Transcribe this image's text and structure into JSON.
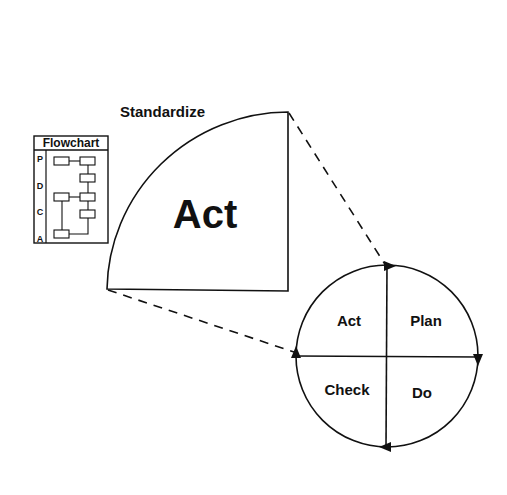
{
  "diagram": {
    "sector": {
      "caption": "Standardize",
      "label": "Act"
    },
    "flowchart": {
      "title": "Flowchart",
      "rows": [
        "P",
        "D",
        "C",
        "A"
      ]
    },
    "cycle": {
      "quadrants": {
        "top_left": "Act",
        "top_right": "Plan",
        "bottom_right": "Do",
        "bottom_left": "Check"
      },
      "direction": "clockwise"
    },
    "colors": {
      "line": "#111111",
      "background": "#ffffff"
    }
  }
}
